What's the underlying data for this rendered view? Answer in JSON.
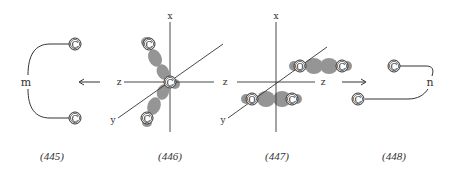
{
  "figures": [
    {
      "id": "445",
      "caption": "(445)",
      "center_label": "m",
      "atoms": [
        "C",
        "C"
      ]
    },
    {
      "id": "446",
      "caption": "(446)",
      "axis_labels": {
        "x": "x",
        "z_left": "z",
        "z_right": "z",
        "y": "y"
      },
      "atoms": [
        "C",
        "C",
        "C"
      ]
    },
    {
      "id": "447",
      "caption": "(447)",
      "axis_labels": {
        "x": "x",
        "z_left": "z",
        "z_right": "z",
        "y": "y"
      },
      "atoms": [
        "O",
        "C",
        "O",
        "C"
      ]
    },
    {
      "id": "448",
      "caption": "(448)",
      "center_label": "n",
      "atoms": [
        "C",
        "C"
      ]
    }
  ],
  "arrows": [
    {
      "direction": "left",
      "between": [
        "445",
        "446"
      ]
    },
    {
      "direction": "right",
      "between": [
        "447",
        "448"
      ]
    }
  ],
  "colors": {
    "line": "#333333",
    "orbital_lobe": "#8a8a8a",
    "background": "#ffffff"
  }
}
